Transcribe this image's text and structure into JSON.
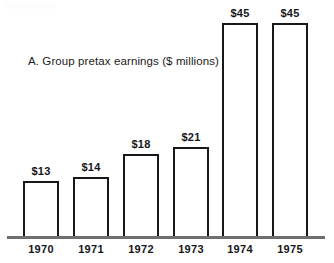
{
  "chart_data": {
    "type": "bar",
    "title": "A. Group pretax earnings ($ millions)",
    "xlabel": "",
    "ylabel": "",
    "categories": [
      "1970",
      "1971",
      "1972",
      "1973",
      "1974",
      "1975"
    ],
    "values": [
      13,
      14,
      18,
      21,
      45,
      45
    ],
    "value_labels": [
      "$13",
      "$14",
      "$18",
      "$21",
      "$45",
      "$45"
    ],
    "ylim": [
      0,
      45
    ],
    "grid": false,
    "legend": "none",
    "units": "$ millions",
    "bar_style": {
      "fill": "#ffffff",
      "outline": "#17181a"
    },
    "axis_color": "#6e6e6e"
  },
  "layout": {
    "bars": [
      {
        "left": 23,
        "width": 36,
        "top": 181
      },
      {
        "left": 73,
        "width": 36,
        "top": 177
      },
      {
        "left": 123,
        "width": 36,
        "top": 154
      },
      {
        "left": 173,
        "width": 36,
        "top": 147
      },
      {
        "left": 222,
        "width": 36,
        "top": 23
      },
      {
        "left": 272,
        "width": 36,
        "top": 23
      }
    ]
  }
}
